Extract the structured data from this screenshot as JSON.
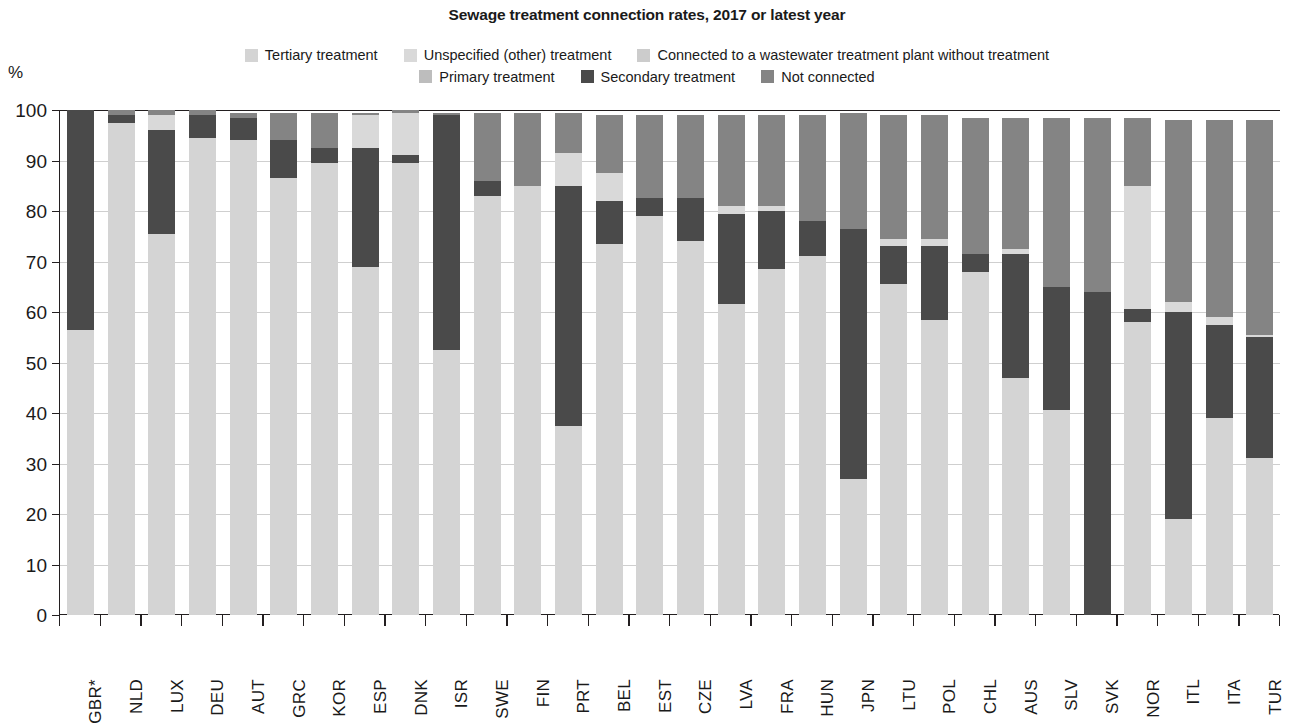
{
  "title": "Sewage treatment connection rates, 2017 or latest year",
  "axis_unit": "%",
  "legend": {
    "rows": [
      [
        {
          "label": "Tertiary treatment",
          "color": "#d4d4d4"
        },
        {
          "label": "Unspecified (other) treatment",
          "color": "#d9d9d9"
        },
        {
          "label": "Connected to a wastewater treatment plant without treatment",
          "color": "#cccccc"
        }
      ],
      [
        {
          "label": "Primary treatment",
          "color": "#bdbdbd"
        },
        {
          "label": "Secondary treatment",
          "color": "#4a4a4a"
        },
        {
          "label": "Not connected",
          "color": "#848484"
        }
      ]
    ]
  },
  "chart_data": {
    "type": "bar",
    "subtype": "stacked-vertical",
    "title": "Sewage treatment connection rates, 2017 or latest year",
    "xlabel": "",
    "ylabel": "%",
    "ylim": [
      0,
      100
    ],
    "yticks": [
      0,
      10,
      20,
      30,
      40,
      50,
      60,
      70,
      80,
      90,
      100
    ],
    "grid": true,
    "legend_position": "top",
    "series_order": [
      "Tertiary treatment",
      "Unspecified (other) treatment",
      "Connected to a wastewater treatment plant without treatment",
      "Primary treatment",
      "Secondary treatment",
      "Not connected"
    ],
    "colors": {
      "Tertiary treatment": "#d4d4d4",
      "Unspecified (other) treatment": "#d9d9d9",
      "Connected to a wastewater treatment plant without treatment": "#cccccc",
      "Primary treatment": "#bdbdbd",
      "Secondary treatment": "#4a4a4a",
      "Not connected": "#848484"
    },
    "categories": [
      "GBR*",
      "NLD",
      "LUX",
      "DEU",
      "AUT",
      "GRC",
      "KOR",
      "ESP",
      "DNK",
      "ISR",
      "SWE",
      "FIN",
      "PRT",
      "BEL",
      "EST",
      "CZE",
      "LVA",
      "FRA",
      "HUN",
      "JPN",
      "LTU",
      "POL",
      "CHL",
      "AUS",
      "SLV",
      "SVK",
      "NOR",
      "ITL",
      "ITA",
      "TUR"
    ],
    "bars": [
      {
        "category": "GBR*",
        "segments": [
          {
            "name": "Tertiary treatment",
            "value": 56.5
          },
          {
            "name": "Secondary treatment",
            "value": 43.5
          },
          {
            "name": "Not connected",
            "value": 0
          }
        ]
      },
      {
        "category": "NLD",
        "segments": [
          {
            "name": "Tertiary treatment",
            "value": 97.5
          },
          {
            "name": "Secondary treatment",
            "value": 1.5
          },
          {
            "name": "Not connected",
            "value": 1.0
          }
        ]
      },
      {
        "category": "LUX",
        "segments": [
          {
            "name": "Tertiary treatment",
            "value": 75.5
          },
          {
            "name": "Secondary treatment",
            "value": 20.5
          },
          {
            "name": "Unspecified (other) treatment",
            "value": 3.0
          },
          {
            "name": "Not connected",
            "value": 1.0
          }
        ]
      },
      {
        "category": "DEU",
        "segments": [
          {
            "name": "Tertiary treatment",
            "value": 94.5
          },
          {
            "name": "Secondary treatment",
            "value": 4.5
          },
          {
            "name": "Not connected",
            "value": 1.0
          }
        ]
      },
      {
        "category": "AUT",
        "segments": [
          {
            "name": "Tertiary treatment",
            "value": 94.0
          },
          {
            "name": "Secondary treatment",
            "value": 4.5
          },
          {
            "name": "Not connected",
            "value": 1.0
          }
        ]
      },
      {
        "category": "GRC",
        "segments": [
          {
            "name": "Tertiary treatment",
            "value": 86.5
          },
          {
            "name": "Secondary treatment",
            "value": 7.5
          },
          {
            "name": "Not connected",
            "value": 5.5
          }
        ]
      },
      {
        "category": "KOR",
        "segments": [
          {
            "name": "Tertiary treatment",
            "value": 89.5
          },
          {
            "name": "Secondary treatment",
            "value": 3.0
          },
          {
            "name": "Not connected",
            "value": 7.0
          }
        ]
      },
      {
        "category": "ESP",
        "segments": [
          {
            "name": "Tertiary treatment",
            "value": 69.0
          },
          {
            "name": "Secondary treatment",
            "value": 23.5
          },
          {
            "name": "Unspecified (other) treatment",
            "value": 6.5
          },
          {
            "name": "Not connected",
            "value": 0.5
          }
        ]
      },
      {
        "category": "DNK",
        "segments": [
          {
            "name": "Tertiary treatment",
            "value": 89.5
          },
          {
            "name": "Secondary treatment",
            "value": 1.5
          },
          {
            "name": "Unspecified (other) treatment",
            "value": 8.5
          },
          {
            "name": "Not connected",
            "value": 0.5
          }
        ]
      },
      {
        "category": "ISR",
        "segments": [
          {
            "name": "Tertiary treatment",
            "value": 52.5
          },
          {
            "name": "Secondary treatment",
            "value": 46.5
          },
          {
            "name": "Not connected",
            "value": 0.5
          }
        ]
      },
      {
        "category": "SWE",
        "segments": [
          {
            "name": "Tertiary treatment",
            "value": 83.0
          },
          {
            "name": "Secondary treatment",
            "value": 3.0
          },
          {
            "name": "Not connected",
            "value": 13.5
          }
        ]
      },
      {
        "category": "FIN",
        "segments": [
          {
            "name": "Tertiary treatment",
            "value": 85.0
          },
          {
            "name": "Not connected",
            "value": 14.5
          }
        ]
      },
      {
        "category": "PRT",
        "segments": [
          {
            "name": "Tertiary treatment",
            "value": 37.5
          },
          {
            "name": "Secondary treatment",
            "value": 47.5
          },
          {
            "name": "Unspecified (other) treatment",
            "value": 6.5
          },
          {
            "name": "Not connected",
            "value": 8.0
          }
        ]
      },
      {
        "category": "BEL",
        "segments": [
          {
            "name": "Tertiary treatment",
            "value": 73.5
          },
          {
            "name": "Secondary treatment",
            "value": 8.5
          },
          {
            "name": "Unspecified (other) treatment",
            "value": 5.5
          },
          {
            "name": "Not connected",
            "value": 11.5
          }
        ]
      },
      {
        "category": "EST",
        "segments": [
          {
            "name": "Tertiary treatment",
            "value": 79.0
          },
          {
            "name": "Secondary treatment",
            "value": 3.5
          },
          {
            "name": "Not connected",
            "value": 16.5
          }
        ]
      },
      {
        "category": "CZE",
        "segments": [
          {
            "name": "Tertiary treatment",
            "value": 74.0
          },
          {
            "name": "Secondary treatment",
            "value": 8.5
          },
          {
            "name": "Not connected",
            "value": 16.5
          }
        ]
      },
      {
        "category": "LVA",
        "segments": [
          {
            "name": "Tertiary treatment",
            "value": 61.5
          },
          {
            "name": "Secondary treatment",
            "value": 18.0
          },
          {
            "name": "Unspecified (other) treatment",
            "value": 1.5
          },
          {
            "name": "Not connected",
            "value": 18.0
          }
        ]
      },
      {
        "category": "FRA",
        "segments": [
          {
            "name": "Tertiary treatment",
            "value": 68.5
          },
          {
            "name": "Secondary treatment",
            "value": 11.5
          },
          {
            "name": "Unspecified (other) treatment",
            "value": 1.0
          },
          {
            "name": "Not connected",
            "value": 18.0
          }
        ]
      },
      {
        "category": "HUN",
        "segments": [
          {
            "name": "Tertiary treatment",
            "value": 71.0
          },
          {
            "name": "Secondary treatment",
            "value": 7.0
          },
          {
            "name": "Not connected",
            "value": 21.0
          }
        ]
      },
      {
        "category": "JPN",
        "segments": [
          {
            "name": "Tertiary treatment",
            "value": 27.0
          },
          {
            "name": "Secondary treatment",
            "value": 49.5
          },
          {
            "name": "Not connected",
            "value": 23.0
          }
        ]
      },
      {
        "category": "LTU",
        "segments": [
          {
            "name": "Tertiary treatment",
            "value": 65.5
          },
          {
            "name": "Secondary treatment",
            "value": 7.5
          },
          {
            "name": "Unspecified (other) treatment",
            "value": 1.5
          },
          {
            "name": "Not connected",
            "value": 24.5
          }
        ]
      },
      {
        "category": "POL",
        "segments": [
          {
            "name": "Tertiary treatment",
            "value": 58.5
          },
          {
            "name": "Secondary treatment",
            "value": 14.5
          },
          {
            "name": "Unspecified (other) treatment",
            "value": 1.5
          },
          {
            "name": "Not connected",
            "value": 24.5
          }
        ]
      },
      {
        "category": "CHL",
        "segments": [
          {
            "name": "Tertiary treatment",
            "value": 68.0
          },
          {
            "name": "Secondary treatment",
            "value": 3.5
          },
          {
            "name": "Not connected",
            "value": 27.0
          }
        ]
      },
      {
        "category": "AUS",
        "segments": [
          {
            "name": "Tertiary treatment",
            "value": 47.0
          },
          {
            "name": "Secondary treatment",
            "value": 24.5
          },
          {
            "name": "Unspecified (other) treatment",
            "value": 1.0
          },
          {
            "name": "Not connected",
            "value": 26.0
          }
        ]
      },
      {
        "category": "SLV",
        "segments": [
          {
            "name": "Tertiary treatment",
            "value": 40.5
          },
          {
            "name": "Secondary treatment",
            "value": 24.5
          },
          {
            "name": "Not connected",
            "value": 33.5
          }
        ]
      },
      {
        "category": "SVK",
        "segments": [
          {
            "name": "Secondary treatment",
            "value": 64.0
          },
          {
            "name": "Not connected",
            "value": 34.5
          }
        ]
      },
      {
        "category": "NOR",
        "segments": [
          {
            "name": "Tertiary treatment",
            "value": 58.0
          },
          {
            "name": "Secondary treatment",
            "value": 2.5
          },
          {
            "name": "Unspecified (other) treatment",
            "value": 24.5
          },
          {
            "name": "Not connected",
            "value": 13.5
          }
        ]
      },
      {
        "category": "ITL",
        "segments": [
          {
            "name": "Tertiary treatment",
            "value": 19.0
          },
          {
            "name": "Secondary treatment",
            "value": 41.0
          },
          {
            "name": "Unspecified (other) treatment",
            "value": 2.0
          },
          {
            "name": "Not connected",
            "value": 36.0
          }
        ]
      },
      {
        "category": "ITA",
        "segments": [
          {
            "name": "Tertiary treatment",
            "value": 39.0
          },
          {
            "name": "Secondary treatment",
            "value": 18.5
          },
          {
            "name": "Unspecified (other) treatment",
            "value": 1.5
          },
          {
            "name": "Not connected",
            "value": 39.0
          }
        ]
      },
      {
        "category": "TUR",
        "segments": [
          {
            "name": "Tertiary treatment",
            "value": 31.0
          },
          {
            "name": "Secondary treatment",
            "value": 24.0
          },
          {
            "name": "Unspecified (other) treatment",
            "value": 0.5
          },
          {
            "name": "Not connected",
            "value": 42.5
          }
        ]
      }
    ]
  }
}
